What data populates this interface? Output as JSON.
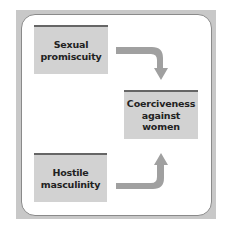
{
  "diagram": {
    "nodes": [
      {
        "id": "sexual-promiscuity",
        "label": "Sexual\npromiscuity"
      },
      {
        "id": "coerciveness",
        "label": "Coerciveness\nagainst\nwomen"
      },
      {
        "id": "hostile-masculinity",
        "label": "Hostile\nmasculinity"
      }
    ],
    "edges": [
      {
        "from": "sexual-promiscuity",
        "to": "coerciveness"
      },
      {
        "from": "hostile-masculinity",
        "to": "coerciveness"
      }
    ],
    "colors": {
      "box_fill": "#d2d2d2",
      "box_top_border": "#666666",
      "arrow": "#a0a0a0",
      "frame": "#c8c8c8"
    }
  }
}
